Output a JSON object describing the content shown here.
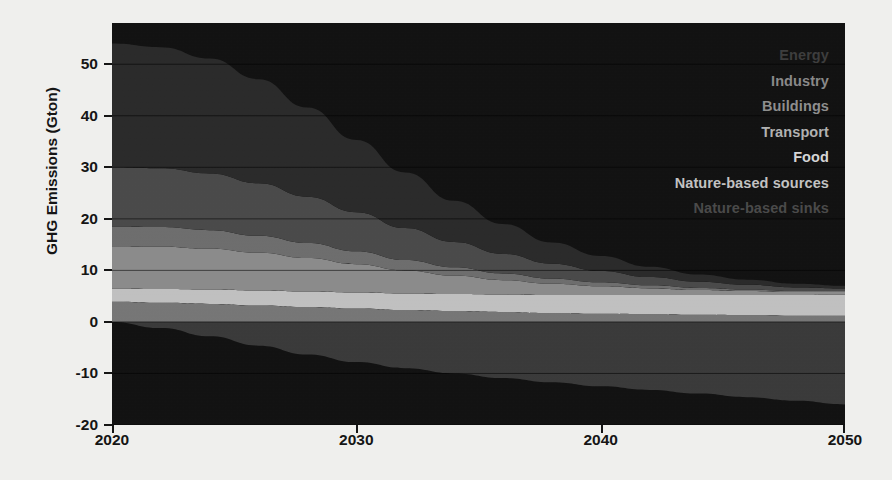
{
  "chart_data": {
    "type": "area",
    "title": "",
    "subtitle": "",
    "xlabel": "",
    "ylabel": "GHG Emissions (Gton)",
    "x": [
      2020,
      2022,
      2024,
      2026,
      2028,
      2030,
      2032,
      2034,
      2036,
      2038,
      2040,
      2042,
      2044,
      2046,
      2048,
      2050
    ],
    "xlim": [
      2020,
      2050
    ],
    "ylim": [
      -20,
      58
    ],
    "xticks": [
      2020,
      2030,
      2040,
      2050
    ],
    "xtick_labels": [
      "2020",
      "2030",
      "2040",
      "2050"
    ],
    "yticks": [
      -20,
      -10,
      0,
      10,
      20,
      30,
      40,
      50
    ],
    "ytick_labels": [
      "-20",
      "-10",
      "0",
      "10",
      "20",
      "30",
      "40",
      "50"
    ],
    "grid": true,
    "grid_axis": "y",
    "legend_position": "top-right-inside",
    "stacked": true,
    "units": "Gton",
    "series": [
      {
        "name": "Energy",
        "color": "#2a2a2a",
        "order": 1,
        "values": [
          24.0,
          23.5,
          22.3,
          20.2,
          17.3,
          14.0,
          10.8,
          8.0,
          5.8,
          4.1,
          2.9,
          2.0,
          1.4,
          1.0,
          0.7,
          0.5
        ]
      },
      {
        "name": "Industry",
        "color": "#4a4a4a",
        "order": 2,
        "values": [
          11.5,
          11.4,
          11.0,
          10.2,
          9.0,
          7.6,
          6.2,
          4.9,
          3.8,
          2.9,
          2.2,
          1.6,
          1.2,
          0.9,
          0.7,
          0.5
        ]
      },
      {
        "name": "Buildings",
        "color": "#6e6e6e",
        "order": 3,
        "values": [
          3.8,
          3.8,
          3.6,
          3.3,
          2.9,
          2.5,
          2.0,
          1.6,
          1.3,
          1.0,
          0.8,
          0.6,
          0.4,
          0.3,
          0.2,
          0.2
        ]
      },
      {
        "name": "Transport",
        "color": "#8c8c8c",
        "order": 4,
        "values": [
          8.2,
          8.2,
          7.9,
          7.3,
          6.5,
          5.5,
          4.5,
          3.6,
          2.8,
          2.2,
          1.7,
          1.3,
          1.0,
          0.8,
          0.6,
          0.5
        ]
      },
      {
        "name": "Food",
        "color": "#c2c2c2",
        "order": 5,
        "values": [
          2.6,
          2.7,
          2.8,
          2.9,
          3.0,
          3.1,
          3.2,
          3.3,
          3.4,
          3.5,
          3.6,
          3.7,
          3.8,
          3.9,
          4.0,
          4.1
        ]
      },
      {
        "name": "Nature-based sources",
        "color": "#777777",
        "order": 6,
        "values": [
          3.9,
          3.7,
          3.5,
          3.2,
          2.9,
          2.6,
          2.3,
          2.1,
          1.9,
          1.7,
          1.6,
          1.5,
          1.4,
          1.3,
          1.2,
          1.2
        ]
      },
      {
        "name": "Nature-based sinks",
        "color": "#3a3a3a",
        "order": 7,
        "negative": true,
        "values": [
          0.0,
          -1.2,
          -2.8,
          -4.6,
          -6.3,
          -7.8,
          -9.0,
          -10.0,
          -10.9,
          -11.7,
          -12.5,
          -13.2,
          -13.9,
          -14.6,
          -15.3,
          -16.0
        ]
      }
    ]
  },
  "axes": {
    "ylabel": "GHG Emissions (Gton)",
    "ytick_labels": [
      "50",
      "40",
      "30",
      "20",
      "10",
      "0",
      "-10",
      "-20"
    ],
    "xtick_labels": [
      "2020",
      "2030",
      "2040",
      "2050"
    ]
  },
  "legend": {
    "items": [
      {
        "label": "Energy",
        "color": "#3d3d3d"
      },
      {
        "label": "Industry",
        "color": "#8a8a8a"
      },
      {
        "label": "Buildings",
        "color": "#8f8f8f"
      },
      {
        "label": "Transport",
        "color": "#b3b3b3"
      },
      {
        "label": "Food",
        "color": "#d8d8d8"
      },
      {
        "label": "Nature-based sources",
        "color": "#c4c4c4"
      },
      {
        "label": "Nature-based sinks",
        "color": "#4a4a4a"
      }
    ]
  },
  "style": {
    "plot_background": "#111111",
    "page_background": "#f2f2f0",
    "axis_color": "#141414",
    "gridline_color": "#000000"
  }
}
